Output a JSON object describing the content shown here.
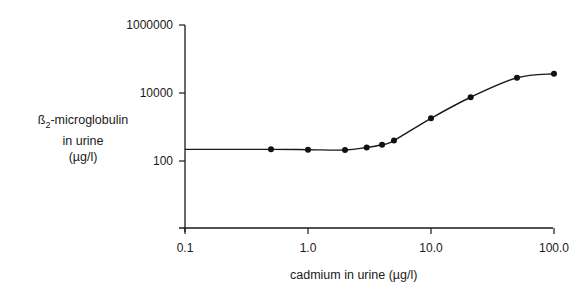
{
  "chart_data": {
    "type": "line",
    "title": "",
    "xlabel": "cadmium in urine (µg/l)",
    "ylabel": "ß2-microglobulin in urine (µg/l)",
    "xscale": "log",
    "yscale": "log",
    "xlim": [
      0.1,
      100.0
    ],
    "ylim": [
      1,
      1000000
    ],
    "x_ticks": [
      "0.1",
      "1.0",
      "10.0",
      "100.0"
    ],
    "y_ticks": [
      "100",
      "10000",
      "1000000"
    ],
    "grid": false,
    "legend": null,
    "series": [
      {
        "name": "ß2-microglobulin vs cadmium",
        "x": [
          0.5,
          1.0,
          2.0,
          3.0,
          4.0,
          5.0,
          10.0,
          21.0,
          50.0,
          100.0
        ],
        "y": [
          220,
          215,
          210,
          250,
          300,
          400,
          1800,
          7500,
          28000,
          37000
        ]
      }
    ]
  },
  "labels": {
    "y_line1_prefix": "ß",
    "y_line1_sub": "2",
    "y_line1_suffix": "-microglobulin",
    "y_line2": "in urine",
    "y_line3": "(µg/l)",
    "x": "cadmium in urine (µg/l)"
  }
}
